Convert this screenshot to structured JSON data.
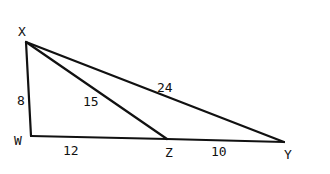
{
  "diagram": {
    "type": "geometry-triangle",
    "vertices": [
      {
        "id": "X",
        "label": "X"
      },
      {
        "id": "W",
        "label": "W"
      },
      {
        "id": "Z",
        "label": "Z"
      },
      {
        "id": "Y",
        "label": "Y"
      }
    ],
    "segments": [
      {
        "from": "X",
        "to": "W",
        "length_label": "8"
      },
      {
        "from": "W",
        "to": "Z",
        "length_label": "12"
      },
      {
        "from": "Z",
        "to": "Y",
        "length_label": "10"
      },
      {
        "from": "X",
        "to": "Z",
        "length_label": "15"
      },
      {
        "from": "X",
        "to": "Y",
        "length_label": "24"
      }
    ],
    "line_color": "#111111",
    "background": "#ffffff"
  }
}
